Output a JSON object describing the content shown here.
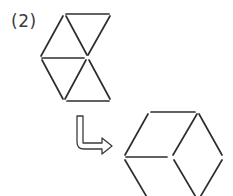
{
  "problem": {
    "label": "(2)"
  },
  "figures": {
    "original": {
      "description": "six-triangle arrangement (hourglass of equilateral triangles)",
      "lines": [
        [
          66,
          14,
          109,
          14
        ],
        [
          63,
          16,
          41,
          56
        ],
        [
          66,
          16,
          87,
          55
        ],
        [
          110,
          16,
          88,
          55
        ],
        [
          42,
          58,
          84,
          58
        ],
        [
          42,
          60,
          63,
          99
        ],
        [
          86,
          60,
          65,
          99
        ],
        [
          89,
          60,
          110,
          99
        ],
        [
          67,
          101,
          109,
          101
        ]
      ]
    },
    "transformed": {
      "description": "rearranged triangles forming hexagon-like shape (cropped at bottom)",
      "lines": [
        [
          151,
          112,
          195,
          112
        ],
        [
          148,
          114,
          125,
          155
        ],
        [
          126,
          157,
          167,
          157
        ],
        [
          197,
          114,
          173,
          155
        ],
        [
          199,
          114,
          222,
          155
        ],
        [
          125,
          160,
          148,
          199
        ],
        [
          174,
          160,
          197,
          199
        ],
        [
          222,
          160,
          199,
          199
        ]
      ]
    },
    "arrow": {
      "direction": "down-then-right",
      "icon": "hook-arrow-icon"
    }
  },
  "colors": {
    "line": "#2e2e2e",
    "background": "#ffffff"
  }
}
